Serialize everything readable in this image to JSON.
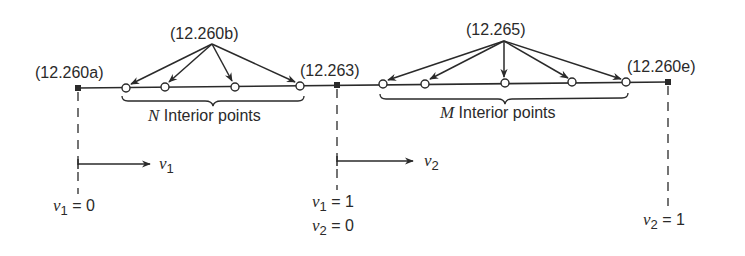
{
  "figure": {
    "colors": {
      "ink": "#2a2a2a",
      "background": "#ffffff"
    },
    "labels": {
      "left_end": "(12.260a)",
      "left_interior_eq": "(12.260b)",
      "junction": "(12.263)",
      "right_interior_eq": "(12.265)",
      "right_end": "(12.260e)"
    },
    "braces": {
      "left": {
        "var": "N",
        "text": " Interior points"
      },
      "right": {
        "var": "M",
        "text": " Interior points"
      }
    },
    "coordinates": {
      "v1_arrow": {
        "var": "v",
        "sub": "1"
      },
      "v2_arrow": {
        "var": "v",
        "sub": "2"
      },
      "left_value": {
        "var": "v",
        "sub": "1",
        "eq": " = 0"
      },
      "junction_value_1": {
        "var": "v",
        "sub": "1",
        "eq": " = 1"
      },
      "junction_value_2": {
        "var": "v",
        "sub": "2",
        "eq": " = 0"
      },
      "right_value": {
        "var": "v",
        "sub": "2",
        "eq": " = 1"
      }
    },
    "nodes": {
      "boundary_squares": 3,
      "left_interior_circles": 4,
      "right_interior_circles": 5
    }
  }
}
